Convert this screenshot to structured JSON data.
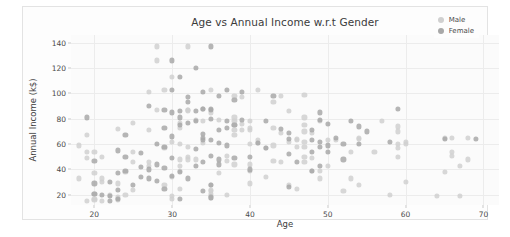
{
  "chart_data": {
    "type": "scatter",
    "title": "Age vs Annual Income w.r.t Gender",
    "xlabel": "Age",
    "ylabel": "Annual Income (k$)",
    "xlim": [
      17,
      72
    ],
    "ylim": [
      12,
      146
    ],
    "xticks": [
      20,
      30,
      40,
      50,
      60,
      70
    ],
    "yticks": [
      20,
      40,
      60,
      80,
      100,
      120,
      140
    ],
    "grid": true,
    "legend_position": "upper right",
    "colors": {
      "male": "#d0d0d0",
      "female": "#a8a8a8",
      "grid": "#ececec",
      "plot_background": "#fbfbfb",
      "figure_background": "#fdfdfd",
      "text": "#3b3b3b"
    },
    "marker_size": 5.2,
    "marker_opacity": 0.85,
    "series": [
      {
        "name": "Male",
        "color": "#d0d0d0",
        "points": [
          [
            19,
            15
          ],
          [
            21,
            15
          ],
          [
            20,
            16
          ],
          [
            23,
            16
          ],
          [
            20,
            17
          ],
          [
            30,
            17
          ],
          [
            35,
            18
          ],
          [
            23,
            18
          ],
          [
            64,
            19
          ],
          [
            30,
            19
          ],
          [
            67,
            19
          ],
          [
            35,
            19
          ],
          [
            58,
            20
          ],
          [
            24,
            20
          ],
          [
            37,
            20
          ],
          [
            22,
            20
          ],
          [
            35,
            21
          ],
          [
            20,
            21
          ],
          [
            52,
            23
          ],
          [
            35,
            23
          ],
          [
            35,
            24
          ],
          [
            25,
            24
          ],
          [
            46,
            25
          ],
          [
            31,
            25
          ],
          [
            54,
            28
          ],
          [
            29,
            28
          ],
          [
            45,
            28
          ],
          [
            35,
            28
          ],
          [
            40,
            29
          ],
          [
            23,
            29
          ],
          [
            60,
            30
          ],
          [
            21,
            30
          ],
          [
            53,
            33
          ],
          [
            18,
            33
          ],
          [
            49,
            33
          ],
          [
            21,
            33
          ],
          [
            42,
            34
          ],
          [
            30,
            34
          ],
          [
            36,
            37
          ],
          [
            20,
            37
          ],
          [
            65,
            38
          ],
          [
            24,
            38
          ],
          [
            48,
            39
          ],
          [
            31,
            39
          ],
          [
            40,
            39
          ],
          [
            49,
            39
          ],
          [
            67,
            43
          ],
          [
            31,
            43
          ],
          [
            50,
            43
          ],
          [
            27,
            43
          ],
          [
            38,
            44
          ],
          [
            40,
            44
          ],
          [
            47,
            46
          ],
          [
            27,
            46
          ],
          [
            44,
            46
          ],
          [
            25,
            46
          ],
          [
            43,
            47
          ],
          [
            37,
            47
          ],
          [
            68,
            48
          ],
          [
            32,
            48
          ],
          [
            33,
            48
          ],
          [
            31,
            48
          ],
          [
            48,
            49
          ],
          [
            19,
            49
          ],
          [
            59,
            50
          ],
          [
            32,
            50
          ],
          [
            47,
            50
          ],
          [
            21,
            50
          ],
          [
            66,
            51
          ],
          [
            37,
            51
          ],
          [
            53,
            54
          ],
          [
            19,
            54
          ],
          [
            66,
            54
          ],
          [
            20,
            54
          ],
          [
            56,
            54
          ],
          [
            25,
            54
          ],
          [
            42,
            57
          ],
          [
            29,
            57
          ],
          [
            59,
            57
          ],
          [
            32,
            58
          ],
          [
            47,
            58
          ],
          [
            46,
            58
          ],
          [
            18,
            59
          ],
          [
            43,
            59
          ],
          [
            59,
            60
          ],
          [
            31,
            60
          ],
          [
            40,
            60
          ],
          [
            60,
            60
          ],
          [
            41,
            61
          ],
          [
            34,
            61
          ],
          [
            47,
            62
          ],
          [
            30,
            62
          ],
          [
            60,
            62
          ],
          [
            45,
            62
          ],
          [
            41,
            63
          ],
          [
            50,
            63
          ],
          [
            46,
            63
          ],
          [
            51,
            63
          ],
          [
            46,
            64
          ],
          [
            54,
            64
          ],
          [
            54,
            65
          ],
          [
            68,
            65
          ],
          [
            66,
            65
          ],
          [
            65,
            65
          ],
          [
            38,
            67
          ],
          [
            19,
            67
          ],
          [
            44,
            69
          ],
          [
            48,
            69
          ],
          [
            59,
            70
          ],
          [
            47,
            70
          ],
          [
            27,
            71
          ],
          [
            38,
            71
          ],
          [
            40,
            71
          ],
          [
            39,
            71
          ],
          [
            23,
            72
          ],
          [
            31,
            73
          ],
          [
            43,
            73
          ],
          [
            40,
            73
          ],
          [
            59,
            74
          ],
          [
            38,
            75
          ],
          [
            47,
            75
          ],
          [
            39,
            76
          ],
          [
            25,
            77
          ],
          [
            31,
            77
          ],
          [
            40,
            78
          ],
          [
            49,
            78
          ],
          [
            34,
            78
          ],
          [
            57,
            78
          ],
          [
            38,
            78
          ],
          [
            36,
            79
          ],
          [
            33,
            79
          ],
          [
            38,
            81
          ],
          [
            47,
            81
          ],
          [
            35,
            85
          ],
          [
            45,
            86
          ],
          [
            32,
            86
          ],
          [
            32,
            87
          ],
          [
            28,
            87
          ],
          [
            32,
            87
          ],
          [
            34,
            88
          ],
          [
            34,
            88
          ],
          [
            43,
            93
          ],
          [
            39,
            97
          ],
          [
            44,
            98
          ],
          [
            38,
            98
          ],
          [
            47,
            99
          ],
          [
            27,
            101
          ],
          [
            29,
            103
          ],
          [
            41,
            103
          ],
          [
            35,
            103
          ],
          [
            30,
            113
          ],
          [
            28,
            126
          ],
          [
            32,
            137
          ],
          [
            28,
            137
          ]
        ]
      },
      {
        "name": "Female",
        "color": "#a8a8a8",
        "points": [
          [
            22,
            15
          ],
          [
            31,
            17
          ],
          [
            23,
            17
          ],
          [
            35,
            18
          ],
          [
            22,
            19
          ],
          [
            21,
            20
          ],
          [
            20,
            21
          ],
          [
            34,
            23
          ],
          [
            23,
            24
          ],
          [
            29,
            25
          ],
          [
            45,
            26
          ],
          [
            25,
            28
          ],
          [
            35,
            28
          ],
          [
            20,
            29
          ],
          [
            22,
            30
          ],
          [
            28,
            31
          ],
          [
            32,
            33
          ],
          [
            27,
            33
          ],
          [
            26,
            34
          ],
          [
            30,
            35
          ],
          [
            23,
            37
          ],
          [
            31,
            38
          ],
          [
            24,
            39
          ],
          [
            48,
            39
          ],
          [
            40,
            40
          ],
          [
            27,
            40
          ],
          [
            29,
            41
          ],
          [
            26,
            42
          ],
          [
            49,
            43
          ],
          [
            33,
            43
          ],
          [
            28,
            44
          ],
          [
            36,
            44
          ],
          [
            34,
            46
          ],
          [
            46,
            46
          ],
          [
            20,
            47
          ],
          [
            36,
            48
          ],
          [
            52,
            48
          ],
          [
            30,
            49
          ],
          [
            38,
            49
          ],
          [
            40,
            50
          ],
          [
            24,
            50
          ],
          [
            35,
            51
          ],
          [
            45,
            52
          ],
          [
            26,
            53
          ],
          [
            50,
            54
          ],
          [
            48,
            54
          ],
          [
            23,
            55
          ],
          [
            33,
            56
          ],
          [
            42,
            57
          ],
          [
            29,
            58
          ],
          [
            49,
            58
          ],
          [
            37,
            59
          ],
          [
            50,
            59
          ],
          [
            52,
            60
          ],
          [
            28,
            60
          ],
          [
            54,
            60
          ],
          [
            41,
            61
          ],
          [
            36,
            61
          ],
          [
            58,
            62
          ],
          [
            49,
            62
          ],
          [
            34,
            63
          ],
          [
            48,
            63
          ],
          [
            35,
            63
          ],
          [
            45,
            64
          ],
          [
            65,
            64
          ],
          [
            69,
            64
          ],
          [
            51,
            65
          ],
          [
            34,
            65
          ],
          [
            30,
            66
          ],
          [
            24,
            67
          ],
          [
            34,
            68
          ],
          [
            45,
            69
          ],
          [
            55,
            70
          ],
          [
            36,
            71
          ],
          [
            48,
            71
          ],
          [
            44,
            72
          ],
          [
            29,
            73
          ],
          [
            37,
            73
          ],
          [
            54,
            74
          ],
          [
            38,
            75
          ],
          [
            31,
            75
          ],
          [
            50,
            76
          ],
          [
            32,
            77
          ],
          [
            42,
            78
          ],
          [
            33,
            78
          ],
          [
            53,
            78
          ],
          [
            37,
            78
          ],
          [
            39,
            79
          ],
          [
            49,
            79
          ],
          [
            35,
            80
          ],
          [
            19,
            81
          ],
          [
            31,
            81
          ],
          [
            30,
            85
          ],
          [
            49,
            85
          ],
          [
            33,
            86
          ],
          [
            31,
            86
          ],
          [
            29,
            87
          ],
          [
            35,
            87
          ],
          [
            35,
            88
          ],
          [
            34,
            88
          ],
          [
            59,
            88
          ],
          [
            27,
            90
          ],
          [
            32,
            93
          ],
          [
            38,
            95
          ],
          [
            32,
            97
          ],
          [
            36,
            98
          ],
          [
            43,
            98
          ],
          [
            34,
            101
          ],
          [
            39,
            101
          ],
          [
            30,
            103
          ],
          [
            37,
            103
          ],
          [
            31,
            113
          ],
          [
            33,
            120
          ],
          [
            30,
            126
          ],
          [
            35,
            137
          ]
        ]
      }
    ]
  }
}
